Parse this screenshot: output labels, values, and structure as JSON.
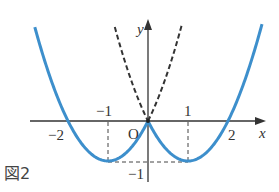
{
  "figure": {
    "caption": "図2",
    "origin_label": "O",
    "x_axis_label": "x",
    "y_axis_label": "y",
    "x_tick_labels": [
      {
        "value": -2,
        "text": "−2"
      },
      {
        "value": -1,
        "text": "−1"
      },
      {
        "value": 1,
        "text": "1"
      },
      {
        "value": 2,
        "text": "2"
      }
    ],
    "y_tick_labels": [
      {
        "value": -1,
        "text": "−1"
      }
    ],
    "colors": {
      "solid_curve": "#3d8fcc",
      "dashed_curve": "#333333",
      "axes": "#333333"
    }
  },
  "chart_data": {
    "type": "line",
    "title": "",
    "xlabel": "x",
    "ylabel": "y",
    "xlim": [
      -2.9,
      2.9
    ],
    "ylim": [
      -1.5,
      2.5
    ],
    "grid": false,
    "series": [
      {
        "name": "y = x^2 - 2|x|",
        "style": "solid blue",
        "x": [
          -2.8,
          -2,
          -1,
          0,
          1,
          2,
          2.8
        ],
        "values": [
          2.24,
          0,
          -1,
          0,
          -1,
          0,
          2.24
        ]
      },
      {
        "name": "y = x^2 + 2|x|",
        "style": "dashed black",
        "x": [
          -0.85,
          -0.5,
          0,
          0.5,
          0.85
        ],
        "values": [
          2.42,
          1.25,
          0,
          1.25,
          2.42
        ]
      }
    ],
    "annotations": [
      "dashed guide lines from (−1,0) and (1,0) down to y=−1",
      "dashed horizontal line at y=−1 between x=−1 and x=1"
    ]
  }
}
